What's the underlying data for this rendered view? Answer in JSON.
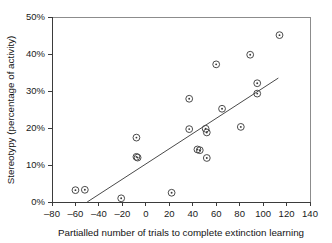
{
  "chart_data": {
    "type": "scatter",
    "title": "",
    "xlabel": "Partialled number of trials to complete extinction learning",
    "ylabel": "Stereotypy (percentage of activity)",
    "xlim": [
      -80,
      140
    ],
    "ylim": [
      0,
      50
    ],
    "xticks": [
      -80,
      -60,
      -40,
      -20,
      0,
      20,
      40,
      60,
      80,
      100,
      120,
      140
    ],
    "xticklabels": [
      "–80",
      "–60",
      "–40",
      "–20",
      "0",
      "20",
      "40",
      "60",
      "80",
      "100",
      "120",
      "140"
    ],
    "yticks": [
      0,
      10,
      20,
      30,
      40,
      50
    ],
    "yticklabels": [
      "0%",
      "10%",
      "20%",
      "30%",
      "40%",
      "50%"
    ],
    "grid": false,
    "legend": null,
    "marker": "circle-with-center-dot",
    "marker_color": "#4a4a4a",
    "points": [
      {
        "x": -60,
        "y": 3.2
      },
      {
        "x": -52,
        "y": 3.3
      },
      {
        "x": -21,
        "y": 1.0
      },
      {
        "x": -8,
        "y": 17.4
      },
      {
        "x": -8,
        "y": 12.2
      },
      {
        "x": -7,
        "y": 12.0
      },
      {
        "x": 22,
        "y": 2.5
      },
      {
        "x": 37,
        "y": 27.9
      },
      {
        "x": 37,
        "y": 19.7
      },
      {
        "x": 44,
        "y": 14.2
      },
      {
        "x": 46,
        "y": 14.0
      },
      {
        "x": 51,
        "y": 19.8
      },
      {
        "x": 52,
        "y": 18.8
      },
      {
        "x": 52,
        "y": 11.9
      },
      {
        "x": 60,
        "y": 37.2
      },
      {
        "x": 65,
        "y": 25.2
      },
      {
        "x": 81,
        "y": 20.3
      },
      {
        "x": 89,
        "y": 39.8
      },
      {
        "x": 95,
        "y": 32.1
      },
      {
        "x": 95,
        "y": 29.3
      },
      {
        "x": 114,
        "y": 45.1
      }
    ],
    "fit_line": {
      "type": "linear-regression",
      "x_start": -50,
      "y_start": 0.0,
      "x_end": 113,
      "y_end": 33.5
    }
  }
}
